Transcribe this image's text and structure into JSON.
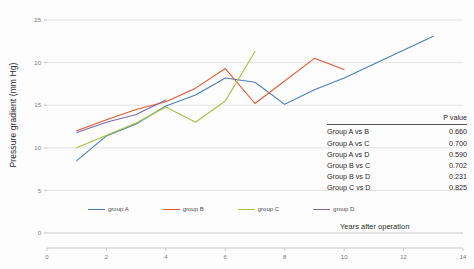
{
  "chart_data": {
    "type": "line",
    "title": "",
    "xlabel": "Years after operation",
    "ylabel": "Pressure gradient (mm Hg)",
    "xlim": [
      0,
      14
    ],
    "ylim": [
      0,
      25
    ],
    "xticks": [
      0,
      2,
      4,
      6,
      8,
      10,
      12,
      14
    ],
    "yticks": [
      0,
      5,
      10,
      15,
      20,
      25
    ],
    "grid": "horizontal",
    "legend_position": "bottom",
    "series": [
      {
        "name": "group A",
        "color": "#4a7ebb",
        "x": [
          1,
          2,
          3,
          4,
          5,
          6,
          7,
          8,
          9,
          10,
          13
        ],
        "y": [
          8.5,
          11.4,
          12.8,
          14.9,
          16.2,
          18.2,
          17.7,
          15.1,
          16.8,
          18.2,
          23.1
        ]
      },
      {
        "name": "group B",
        "color": "#e0562f",
        "x": [
          1,
          2,
          3,
          4,
          5,
          6,
          7,
          9,
          10
        ],
        "y": [
          12.0,
          13.3,
          14.5,
          15.4,
          17.0,
          19.3,
          15.2,
          20.5,
          19.2
        ]
      },
      {
        "name": "group C",
        "color": "#a5c43c",
        "x": [
          1,
          3,
          4,
          5,
          6,
          7
        ],
        "y": [
          10.0,
          12.9,
          14.8,
          13.0,
          15.5,
          21.3
        ]
      },
      {
        "name": "group D",
        "color": "#7a6aa8",
        "x": [
          1,
          2,
          3,
          4
        ],
        "y": [
          11.8,
          13.0,
          13.9,
          15.6
        ]
      }
    ]
  },
  "pvalue_table": {
    "header_label": "",
    "header_value": "P value",
    "rows": [
      {
        "pair": "Group A vs B",
        "value": "0.660"
      },
      {
        "pair": "Group A vs C",
        "value": "0.700"
      },
      {
        "pair": "Group A vs D",
        "value": "0.590"
      },
      {
        "pair": "Group B vs C",
        "value": "0.702"
      },
      {
        "pair": "Group B vs D",
        "value": "0.231"
      },
      {
        "pair": "Group C vs D",
        "value": "0.825"
      }
    ]
  }
}
